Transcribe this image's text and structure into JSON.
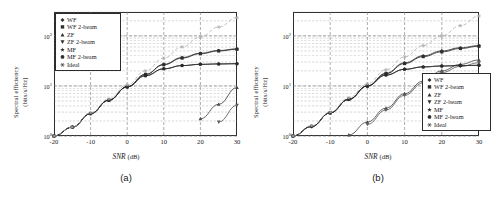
{
  "figure": {
    "panels": [
      {
        "caption": "(a)",
        "xlabel_main": "SNR",
        "xlabel_unit": "(dB)",
        "ylabel_line1": "Spectral efficiency",
        "ylabel_line2": "(bits/s/Hz)",
        "legend_position": "top-left"
      },
      {
        "caption": "(b)",
        "xlabel_main": "SNR",
        "xlabel_unit": "(dB)",
        "ylabel_line1": "Spectral efficiency",
        "ylabel_line2": "(bits/s/Hz)",
        "legend_position": "bottom-right"
      }
    ],
    "legend_labels": [
      "WF",
      "WF 2-beam",
      "ZF",
      "ZF 2-beam",
      "MF",
      "MF 2-beam",
      "Ideal"
    ],
    "legend_markers": [
      "diamond",
      "square",
      "triangle-up",
      "triangle-down",
      "star",
      "circle",
      "asterisk"
    ],
    "xticks": [
      "-20",
      "-10",
      "0",
      "10",
      "20",
      "30"
    ],
    "yticks": [
      "10",
      "10",
      "10"
    ],
    "ytick_exponents": [
      "0",
      "1",
      "2"
    ],
    "colors": {
      "axis": "#2b2b2b",
      "grid": "#8a8a8a",
      "curve_dark": "#2f2f2f",
      "curve_mid": "#5a5a5a",
      "curve_light": "#9a9a9a"
    }
  },
  "chart_data": [
    {
      "type": "line",
      "title": "(a)",
      "xlabel": "SNR (dB)",
      "ylabel": "Spectral efficiency (bits/s/Hz)",
      "xlim": [
        -20,
        30
      ],
      "ylim": [
        1,
        300
      ],
      "yscale": "log",
      "xticks": [
        -20,
        -10,
        0,
        10,
        20,
        30
      ],
      "yticks": [
        1,
        10,
        100
      ],
      "grid": true,
      "legend_position": "upper left",
      "x": [
        -20,
        -15,
        -10,
        -5,
        0,
        5,
        10,
        15,
        20,
        25,
        30
      ],
      "series": [
        {
          "name": "WF",
          "marker": "diamond",
          "values": [
            1.0,
            1.5,
            2.8,
            5.2,
            9.6,
            17.0,
            27.0,
            37.0,
            45.0,
            51.0,
            55.0
          ]
        },
        {
          "name": "WF 2-beam",
          "marker": "square",
          "values": [
            1.0,
            1.5,
            2.8,
            5.2,
            9.6,
            17.0,
            26.5,
            36.0,
            44.0,
            50.0,
            54.0
          ]
        },
        {
          "name": "ZF",
          "marker": "triangle-up",
          "values": [
            null,
            null,
            null,
            null,
            null,
            null,
            null,
            null,
            2.2,
            4.3,
            9.3
          ]
        },
        {
          "name": "ZF 2-beam",
          "marker": "triangle-down",
          "values": [
            null,
            null,
            null,
            null,
            null,
            null,
            null,
            null,
            null,
            1.9,
            4.1
          ]
        },
        {
          "name": "MF",
          "marker": "star",
          "values": [
            1.0,
            1.5,
            2.8,
            5.2,
            9.6,
            16.0,
            22.0,
            25.5,
            27.0,
            27.5,
            27.8
          ]
        },
        {
          "name": "MF 2-beam",
          "marker": "circle",
          "values": [
            1.0,
            1.5,
            2.8,
            5.2,
            9.6,
            16.0,
            22.0,
            25.5,
            27.0,
            27.5,
            27.8
          ]
        },
        {
          "name": "Ideal",
          "marker": "asterisk",
          "values": [
            1.0,
            1.5,
            2.9,
            5.5,
            10.5,
            20.0,
            36.0,
            60.0,
            95.0,
            150.0,
            230.0
          ]
        }
      ]
    },
    {
      "type": "line",
      "title": "(b)",
      "xlabel": "SNR (dB)",
      "ylabel": "Spectral efficiency (bits/s/Hz)",
      "xlim": [
        -20,
        30
      ],
      "ylim": [
        1,
        300
      ],
      "yscale": "log",
      "xticks": [
        -20,
        -10,
        0,
        10,
        20,
        30
      ],
      "yticks": [
        1,
        10,
        100
      ],
      "grid": true,
      "legend_position": "lower right",
      "x": [
        -20,
        -15,
        -10,
        -5,
        0,
        5,
        10,
        15,
        20,
        25,
        30
      ],
      "series": [
        {
          "name": "WF",
          "marker": "diamond",
          "values": [
            1.0,
            1.55,
            2.9,
            5.4,
            10.0,
            18.0,
            29.0,
            40.0,
            50.0,
            58.0,
            64.0
          ]
        },
        {
          "name": "WF 2-beam",
          "marker": "square",
          "values": [
            1.0,
            1.55,
            2.9,
            5.4,
            10.0,
            17.5,
            28.0,
            38.5,
            48.0,
            56.0,
            62.0
          ]
        },
        {
          "name": "ZF",
          "marker": "triangle-up",
          "values": [
            null,
            null,
            null,
            1.05,
            1.9,
            3.6,
            7.0,
            12.5,
            20.0,
            27.0,
            33.0
          ]
        },
        {
          "name": "ZF 2-beam",
          "marker": "triangle-down",
          "values": [
            null,
            null,
            null,
            null,
            1.7,
            3.3,
            6.5,
            11.5,
            18.5,
            24.5,
            29.0
          ]
        },
        {
          "name": "MF",
          "marker": "star",
          "values": [
            1.0,
            1.55,
            2.9,
            5.4,
            10.0,
            16.5,
            21.5,
            24.0,
            25.0,
            25.5,
            25.8
          ]
        },
        {
          "name": "MF 2-beam",
          "marker": "circle",
          "values": [
            1.0,
            1.55,
            2.9,
            5.4,
            10.0,
            16.5,
            21.5,
            24.0,
            25.0,
            25.5,
            25.8
          ]
        },
        {
          "name": "Ideal",
          "marker": "asterisk",
          "values": [
            1.0,
            1.6,
            3.0,
            5.8,
            11.0,
            21.0,
            38.0,
            64.0,
            100.0,
            160.0,
            250.0
          ]
        }
      ]
    }
  ]
}
